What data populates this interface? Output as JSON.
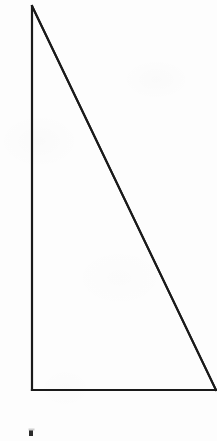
{
  "figure": {
    "background_color": "#fdfdfd",
    "stroke_color": "#1a1a1a",
    "stroke_width": 2,
    "width": 217,
    "height": 441,
    "caption": ""
  },
  "chart_data": {
    "type": "diagram",
    "shape": "right-triangle",
    "xlabel": "",
    "ylabel": "",
    "vertices": [
      {
        "name": "apex",
        "label": "",
        "x": 32,
        "y": 6
      },
      {
        "name": "right-angle-corner",
        "label": "",
        "x": 32,
        "y": 390
      },
      {
        "name": "base-right",
        "label": "",
        "x": 216,
        "y": 390
      }
    ],
    "edges": [
      {
        "name": "vertical-leg",
        "from": "apex",
        "to": "right-angle-corner",
        "length_px": 384,
        "label": ""
      },
      {
        "name": "horizontal-leg",
        "from": "right-angle-corner",
        "to": "base-right",
        "length_px": 184,
        "label": ""
      },
      {
        "name": "hypotenuse",
        "from": "base-right",
        "to": "apex",
        "length_px": 426,
        "label": ""
      }
    ],
    "right_angle_at": "right-angle-corner",
    "grid": false,
    "legend": null,
    "annotations": [
      {
        "name": "bottom-mark",
        "text": "",
        "x": 31,
        "y": 433,
        "width": 4,
        "height": 6
      }
    ]
  }
}
